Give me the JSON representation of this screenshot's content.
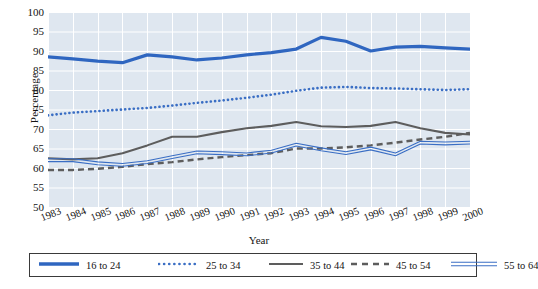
{
  "chart_data": {
    "type": "line",
    "title": "",
    "xlabel": "Year",
    "ylabel": "Percentage",
    "ylim": [
      50,
      100
    ],
    "y_ticks": [
      100,
      95,
      90,
      85,
      80,
      75,
      70,
      65,
      60,
      55,
      50
    ],
    "grid": true,
    "legend_position": "bottom",
    "x": [
      1983,
      1984,
      1985,
      1986,
      1987,
      1988,
      1989,
      1990,
      1991,
      1992,
      1993,
      1994,
      1995,
      1996,
      1997,
      1998,
      1999,
      2000
    ],
    "categories": [
      "1983",
      "1984",
      "1985",
      "1986",
      "1987",
      "1988",
      "1989",
      "1990",
      "1991",
      "1992",
      "1993",
      "1994",
      "1995",
      "1996",
      "1997",
      "1998",
      "1999",
      "2000"
    ],
    "series": [
      {
        "name": "16 to 24",
        "style": "solid-thick",
        "color": "#2f66c0",
        "values": [
          88.5,
          88.0,
          87.4,
          87.0,
          89.0,
          88.5,
          87.7,
          88.2,
          89.0,
          89.6,
          90.5,
          93.5,
          92.5,
          90.0,
          91.0,
          91.2,
          90.8,
          90.5
        ]
      },
      {
        "name": "25 to 34",
        "style": "dotted",
        "color": "#3a6ec4",
        "values": [
          73.5,
          74.2,
          74.6,
          75.0,
          75.4,
          76.0,
          76.7,
          77.3,
          78.0,
          78.8,
          79.8,
          80.6,
          80.8,
          80.5,
          80.4,
          80.2,
          80.0,
          80.2
        ]
      },
      {
        "name": "35 to 44",
        "style": "solid-gray",
        "color": "#5d5d5d",
        "values": [
          62.5,
          62.2,
          62.5,
          63.8,
          65.8,
          68.0,
          68.0,
          69.2,
          70.2,
          70.8,
          71.8,
          70.7,
          70.5,
          70.8,
          71.8,
          70.2,
          69.0,
          68.6
        ]
      },
      {
        "name": "45 to 54",
        "style": "dashed-gray",
        "color": "#5d5d5d",
        "values": [
          59.5,
          59.5,
          59.8,
          60.3,
          61.0,
          61.5,
          62.2,
          62.8,
          63.3,
          63.8,
          65.0,
          65.0,
          65.3,
          65.8,
          66.5,
          67.3,
          68.0,
          69.0
        ]
      },
      {
        "name": "55 to 64",
        "style": "double-thin-blue",
        "color": "#3a6ec4",
        "values": [
          62.0,
          62.0,
          61.2,
          60.8,
          61.5,
          62.8,
          64.0,
          63.8,
          63.5,
          64.2,
          66.0,
          64.8,
          63.8,
          65.0,
          63.5,
          66.5,
          66.3,
          66.5
        ]
      }
    ]
  },
  "legend": {
    "items": [
      {
        "label": "16 to 24"
      },
      {
        "label": "25 to 34"
      },
      {
        "label": "35 to 44"
      },
      {
        "label": "45 to 54"
      },
      {
        "label": "55 to 64"
      }
    ]
  },
  "colors": {
    "plot_background": "#dfe7f0",
    "gridline": "#ffffff",
    "series_blue": "#2f66c0",
    "series_gray": "#5d5d5d",
    "legend_border": "#3a3a3a",
    "text": "#141414"
  }
}
